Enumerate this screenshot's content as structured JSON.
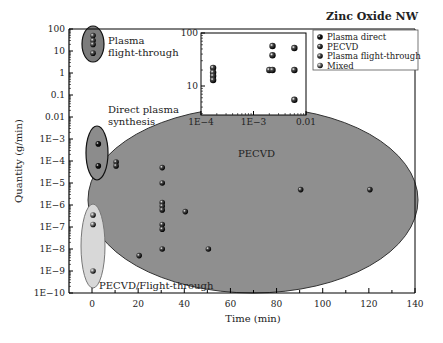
{
  "chart_data": [
    {
      "type": "scatter",
      "title": "Zinc Oxide NW",
      "xlabel": "Time (min)",
      "ylabel": "Quantity (g/min)",
      "xscale": "linear",
      "yscale": "log",
      "xlim": [
        -10,
        140
      ],
      "ylim": [
        1e-10,
        100
      ],
      "xticks": [
        0,
        20,
        40,
        60,
        80,
        100,
        120,
        140
      ],
      "xtick_labels": [
        "0",
        "20",
        "40",
        "60",
        "80",
        "100",
        "120",
        "140"
      ],
      "yticks": [
        1e-10,
        1e-09,
        1e-08,
        1e-07,
        1e-06,
        1e-05,
        0.0001,
        0.001,
        0.01,
        0.1,
        1,
        10,
        100
      ],
      "ytick_labels": [
        "1E−10",
        "1E−9",
        "1E−8",
        "1E−7",
        "1E−6",
        "1E−5",
        "1E−4",
        "1E−3",
        "0.01",
        "0.1",
        "1",
        "10",
        "100"
      ],
      "grid": false,
      "legend_position": "upper right",
      "series": [
        {
          "name": "Plasma direct",
          "color": "#1a1a1a",
          "points": [
            [
              1,
              0.0006
            ],
            [
              1,
              6e-05
            ]
          ]
        },
        {
          "name": "PECVD",
          "color": "#4a4a4a",
          "points": [
            [
              10,
              9e-05
            ],
            [
              10,
              6e-05
            ],
            [
              30,
              5e-05
            ],
            [
              30,
              1e-05
            ],
            [
              30,
              1.3e-06
            ],
            [
              30,
              9e-07
            ],
            [
              30,
              6e-07
            ],
            [
              30,
              1.3e-07
            ],
            [
              30,
              8e-08
            ],
            [
              30,
              1e-08
            ],
            [
              40,
              5e-07
            ],
            [
              20,
              5e-09
            ],
            [
              50,
              1e-08
            ],
            [
              90,
              5e-06
            ],
            [
              120,
              5e-06
            ]
          ]
        },
        {
          "name": "Plasma flight-through",
          "color": "#5a5a5a",
          "points": [
            [
              0,
              50
            ],
            [
              0,
              30
            ],
            [
              0,
              20
            ],
            [
              0,
              8
            ]
          ]
        },
        {
          "name": "Mixed",
          "color": "#8a8a8a",
          "points": [
            [
              0,
              3.5e-07
            ],
            [
              0,
              1.3e-07
            ],
            [
              0,
              1e-09
            ]
          ]
        }
      ],
      "regions": [
        {
          "name": "Plasma flight-through",
          "label": "Plasma\nflight-through",
          "fill": "#7c7c7c"
        },
        {
          "name": "Direct plasma synthesis",
          "label": "Direct plasma\nsynthesis",
          "fill": "#8c8c8c"
        },
        {
          "name": "PECVD",
          "label": "PECVD",
          "fill": "#8f8f8f"
        },
        {
          "name": "PECVD/Flight-through",
          "label": "PECVD/Flight-through",
          "fill": "#d8d8d8"
        }
      ]
    },
    {
      "type": "scatter",
      "title": "inset",
      "xscale": "log",
      "yscale": "log",
      "xlim": [
        0.0001,
        0.01
      ],
      "ylim": [
        3,
        100
      ],
      "xtick_labels": [
        "1E−4",
        "1E−3",
        "0.01"
      ],
      "ytick_labels": [
        "10",
        "100"
      ],
      "points": [
        [
          0.00017,
          22
        ],
        [
          0.00017,
          18
        ],
        [
          0.00017,
          15.5
        ],
        [
          0.00017,
          13
        ],
        [
          0.002,
          20
        ],
        [
          0.0023,
          20
        ],
        [
          0.0023,
          38
        ],
        [
          0.0023,
          57
        ],
        [
          0.006,
          52
        ],
        [
          0.006,
          20
        ],
        [
          0.006,
          5.5
        ]
      ]
    }
  ],
  "legend": {
    "items": [
      {
        "label": "Plasma direct",
        "color": "#1a1a1a"
      },
      {
        "label": "PECVD",
        "color": "#4a4a4a"
      },
      {
        "label": "Plasma flight-through",
        "color": "#5a5a5a"
      },
      {
        "label": "Mixed",
        "color": "#8a8a8a"
      }
    ]
  },
  "labels": {
    "title": "Zinc Oxide NW",
    "xlabel": "Time (min)",
    "ylabel": "Quantity (g/min)",
    "region_flight_1": "Plasma",
    "region_flight_2": "flight-through",
    "region_direct_1": "Direct plasma",
    "region_direct_2": "synthesis",
    "region_pecvd": "PECVD",
    "region_mixed": "PECVD/Flight-through"
  }
}
